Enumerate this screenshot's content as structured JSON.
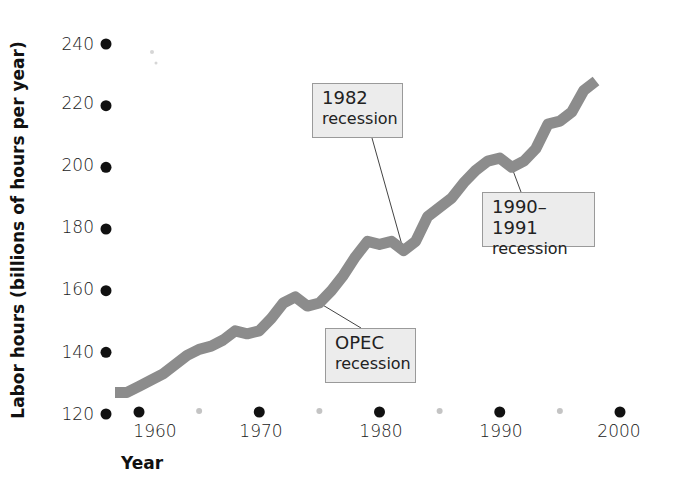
{
  "chart_data": {
    "type": "line",
    "title": "",
    "xlabel": "Year",
    "ylabel": "Labor hours (billions of hours per year)",
    "xlim": [
      1958,
      2000
    ],
    "ylim": [
      120,
      240
    ],
    "x_ticks": [
      1960,
      1970,
      1980,
      1990,
      2000
    ],
    "x_minor_ticks": [
      1965,
      1975,
      1985,
      1995
    ],
    "y_ticks": [
      120,
      140,
      160,
      180,
      200,
      220,
      240
    ],
    "grid": false,
    "legend": null,
    "series": [
      {
        "name": "Labor hours",
        "color": "#8c8c8c",
        "x": [
          1958,
          1959,
          1960,
          1961,
          1962,
          1963,
          1964,
          1965,
          1966,
          1967,
          1968,
          1969,
          1970,
          1971,
          1972,
          1973,
          1974,
          1975,
          1976,
          1977,
          1978,
          1979,
          1980,
          1981,
          1982,
          1983,
          1984,
          1985,
          1986,
          1987,
          1988,
          1989,
          1990,
          1991,
          1992,
          1993,
          1994,
          1995,
          1996,
          1997,
          1998
        ],
        "values": [
          127,
          127,
          129,
          131,
          133,
          136,
          139,
          141,
          142,
          144,
          147,
          146,
          147,
          151,
          156,
          158,
          155,
          156,
          160,
          165,
          171,
          176,
          175,
          176,
          173,
          176,
          184,
          187,
          190,
          195,
          199,
          202,
          203,
          200,
          202,
          206,
          214,
          215,
          218,
          225,
          228
        ]
      }
    ],
    "annotations": [
      {
        "id": "opec",
        "line1": "OPEC",
        "line2": "recession",
        "points_to": {
          "x": 1975,
          "y": 156
        }
      },
      {
        "id": "r1982",
        "line1": "1982",
        "line2": "recession",
        "points_to": {
          "x": 1982,
          "y": 173
        }
      },
      {
        "id": "r1990",
        "line1": "1990–1991",
        "line2": "recession",
        "points_to": {
          "x": 1991,
          "y": 200
        }
      }
    ]
  },
  "axes": {
    "y_tick_labels": [
      "240",
      "220",
      "200",
      "180",
      "160",
      "140",
      "120"
    ],
    "x_tick_labels": [
      "1960",
      "1970",
      "1980",
      "1990",
      "2000"
    ],
    "xlabel": "Year",
    "ylabel": "Labor hours (billions of hours per year)"
  },
  "annotations": {
    "opec": {
      "line1": "OPEC",
      "line2": "recession"
    },
    "r1982": {
      "line1": "1982",
      "line2": "recession"
    },
    "r1990": {
      "line1": "1990–1991",
      "line2": "recession"
    }
  }
}
